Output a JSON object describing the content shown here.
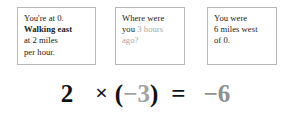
{
  "boxes": [
    {
      "name": "starting-position",
      "lines": [
        {
          "text": "You're at 0.",
          "style": "normal"
        },
        {
          "text": "Walking east",
          "style": "bold"
        },
        {
          "text": "at 2 miles",
          "style": "normal"
        },
        {
          "text": "per hour.",
          "style": "normal"
        }
      ]
    },
    {
      "name": "question",
      "lines": [
        {
          "text": "Where were",
          "style": "normal"
        },
        {
          "text": "you ",
          "style": "normal",
          "trailing_muted": "3 hours"
        },
        {
          "text": "ago?",
          "style": "muted"
        }
      ]
    },
    {
      "name": "answer",
      "lines": [
        {
          "text": "You were",
          "style": "normal"
        },
        {
          "text": "6 miles west",
          "style": "normal"
        },
        {
          "text": "of 0.",
          "style": "normal"
        }
      ]
    }
  ],
  "equation": {
    "factor_a": "2",
    "operator": "×",
    "paren_open": "(",
    "factor_b": "−3",
    "paren_close": ")",
    "equals": "=",
    "result": "−6",
    "full_text": "2 × (−3) = −6"
  },
  "colors": {
    "background": "#ffffff",
    "text": "#1b1b1b",
    "muted_text": "#a8a8a8",
    "equation_muted": "#a3a3a3",
    "result_muted": "#8f8f8f",
    "box_border": "#b9b9b9"
  }
}
